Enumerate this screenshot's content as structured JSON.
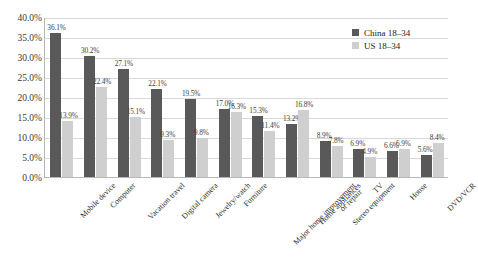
{
  "chart_data": {
    "type": "bar",
    "title": "",
    "subtitle": "",
    "xlabel": "",
    "ylabel": "",
    "ylim": [
      0,
      40
    ],
    "ytick_labels": [
      "0.0%",
      "5.0%",
      "10.0%",
      "15.0%",
      "20.0%",
      "25.0%",
      "30.0%",
      "35.0%",
      "40.0%"
    ],
    "ytick_values": [
      0,
      5,
      10,
      15,
      20,
      25,
      30,
      35,
      40
    ],
    "grid": true,
    "legend_position": "top-right",
    "categories": [
      "Mobile device",
      "Computer",
      "Vacation travel",
      "Digital camera",
      "Jewelry/watch",
      "Furniture",
      "Major home improvement\nor repair",
      "Home appliances",
      "Stereo equipment",
      "TV",
      "House",
      "DVD/VCR"
    ],
    "series": [
      {
        "name": "China 18–34",
        "color": "#595959",
        "values": [
          36.1,
          30.2,
          27.1,
          22.1,
          19.5,
          17.0,
          15.3,
          13.2,
          8.9,
          6.9,
          6.6,
          5.6
        ],
        "labels": [
          "36.1%",
          "30.2%",
          "27.1%",
          "22.1%",
          "19.5%",
          "17.0%",
          "15.3%",
          "13.2%",
          "8.9%",
          "6.9%",
          "6.6%",
          "5.6%"
        ]
      },
      {
        "name": "US 18–34",
        "color": "#cfcfcf",
        "values": [
          13.9,
          22.4,
          15.1,
          9.3,
          9.8,
          16.3,
          11.4,
          16.8,
          7.8,
          4.9,
          6.9,
          8.4
        ],
        "labels": [
          "13.9%",
          "22.4%",
          "15.1%",
          "9.3%",
          "9.8%",
          "16.3%",
          "11.4%",
          "16.8%",
          "7.8%",
          "4.9%",
          "6.9%",
          "8.4%"
        ]
      }
    ]
  },
  "legend": {
    "items": [
      {
        "label": "China 18–34",
        "color": "#595959"
      },
      {
        "label": "US 18–34",
        "color": "#cfcfcf"
      }
    ]
  }
}
